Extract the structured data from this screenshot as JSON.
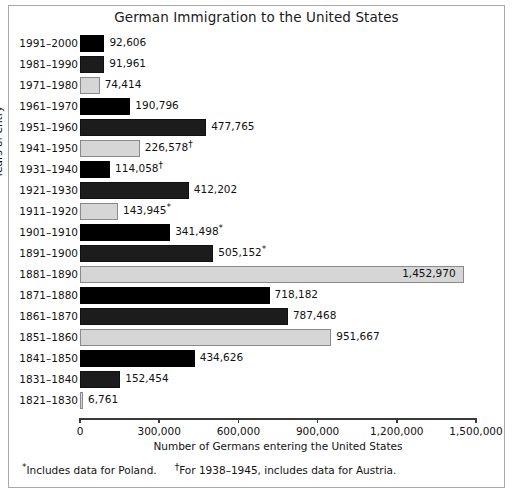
{
  "chart_data": {
    "type": "bar",
    "orientation": "horizontal",
    "title": "German Immigration to the United States",
    "xlabel": "Number of Germans entering the United States",
    "ylabel": "Years of entry",
    "xlim": [
      0,
      1500000
    ],
    "xticks": [
      0,
      300000,
      600000,
      900000,
      1200000,
      1500000
    ],
    "xtick_labels": [
      "0",
      "300,000",
      "600,000",
      "900,000",
      "1,200,000",
      "1,500,000"
    ],
    "grid": false,
    "legend": null,
    "categories": [
      "1991–2000",
      "1981–1990",
      "1971–1980",
      "1961–1970",
      "1951–1960",
      "1941–1950",
      "1931–1940",
      "1921–1930",
      "1911–1920",
      "1901–1910",
      "1891–1900",
      "1881–1890",
      "1871–1880",
      "1861–1870",
      "1851–1860",
      "1841–1850",
      "1831–1840",
      "1821–1830"
    ],
    "values": [
      92606,
      91961,
      74414,
      190796,
      477765,
      226578,
      114058,
      412202,
      143945,
      341498,
      505152,
      1452970,
      718182,
      787468,
      951667,
      434626,
      152454,
      6761
    ],
    "value_labels": [
      "92,606",
      "91,961",
      "74,414",
      "190,796",
      "477,765",
      "226,578",
      "114,058",
      "412,202",
      "143,945",
      "341,498",
      "505,152",
      "1,452,970",
      "718,182",
      "787,468",
      "951,667",
      "434,626",
      "152,454",
      "6,761"
    ],
    "value_marks": [
      "",
      "",
      "",
      "",
      "",
      "†",
      "†",
      "",
      "*",
      "*",
      "*",
      "",
      "",
      "",
      "",
      "",
      "",
      ""
    ],
    "bar_styles": [
      "dark",
      "mid",
      "light",
      "dark",
      "mid",
      "light",
      "dark",
      "mid",
      "light",
      "dark",
      "mid",
      "light",
      "dark",
      "mid",
      "light",
      "dark",
      "mid",
      "light"
    ],
    "label_placement": [
      "outside",
      "outside",
      "outside",
      "outside",
      "outside",
      "outside",
      "outside",
      "outside",
      "outside",
      "outside",
      "outside",
      "inside",
      "outside",
      "outside",
      "outside",
      "outside",
      "outside",
      "outside"
    ],
    "colors": {
      "dark": "#000000",
      "mid": "#1c1c1c",
      "light": "#d6d6d6",
      "light_border": "#8a8a8a",
      "axis": "#3a3a3a",
      "text": "#111111",
      "background": "#ffffff",
      "frame_border": "#a9a9a9"
    }
  },
  "footnotes": {
    "poland_mark": "*",
    "poland_text": "Includes data for Poland.",
    "austria_mark": "†",
    "austria_text": "For 1938–1945, includes data for Austria."
  }
}
